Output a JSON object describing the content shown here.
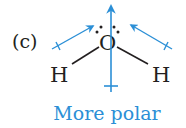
{
  "panel_label": "(c)",
  "molecule": {
    "central_atom": "O",
    "left_atom": "H",
    "right_atom": "H",
    "lone_pairs": 2
  },
  "dipole_arrows": {
    "color": "#2b8fd6",
    "bond_dipoles": [
      "left O-H bond dipole",
      "right O-H bond dipole"
    ],
    "net_dipole": "net molecular dipole (upward)"
  },
  "caption": "More polar",
  "colors": {
    "text": "#231f20",
    "accent": "#2b8fd6"
  }
}
